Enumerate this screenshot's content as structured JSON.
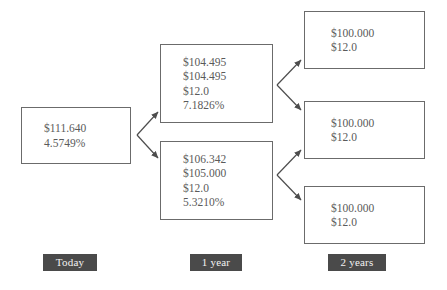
{
  "diagram": {
    "type": "binomial-tree",
    "title": "",
    "columns": [
      {
        "id": "today",
        "label": "Today"
      },
      {
        "id": "one-year",
        "label": "1 year"
      },
      {
        "id": "two-years",
        "label": "2 years"
      }
    ],
    "nodes": [
      {
        "id": "root",
        "column": "today",
        "position": "root",
        "lines": [
          "$111.640",
          "4.5749%"
        ]
      },
      {
        "id": "year1-up",
        "column": "one-year",
        "position": "upper",
        "lines": [
          "$104.495",
          "$104.495",
          "$12.0",
          "7.1826%"
        ]
      },
      {
        "id": "year1-down",
        "column": "one-year",
        "position": "lower",
        "lines": [
          "$106.342",
          "$105.000",
          "$12.0",
          "5.3210%"
        ]
      },
      {
        "id": "year2-top",
        "column": "two-years",
        "position": "top",
        "lines": [
          "$100.000",
          "$12.0"
        ]
      },
      {
        "id": "year2-middle",
        "column": "two-years",
        "position": "middle",
        "lines": [
          "$100.000",
          "$12.0"
        ]
      },
      {
        "id": "year2-bottom",
        "column": "two-years",
        "position": "bottom",
        "lines": [
          "$100.000",
          "$12.0"
        ]
      }
    ],
    "edges": [
      {
        "from": "root",
        "to": "year1-up"
      },
      {
        "from": "root",
        "to": "year1-down"
      },
      {
        "from": "year1-up",
        "to": "year2-top"
      },
      {
        "from": "year1-up",
        "to": "year2-middle"
      },
      {
        "from": "year1-down",
        "to": "year2-middle"
      },
      {
        "from": "year1-down",
        "to": "year2-bottom"
      }
    ],
    "colors": {
      "box_border": "#6b6b6b",
      "text": "#5a5a5a",
      "arrow": "#4d4d4d",
      "label_background": "#4a4a4a",
      "label_text": "#f2f2f2",
      "canvas_background": "#ffffff"
    }
  }
}
